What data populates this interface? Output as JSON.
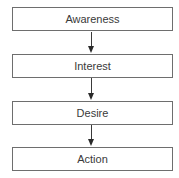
{
  "diagram": {
    "type": "flowchart",
    "direction": "top-to-bottom",
    "nodes": [
      {
        "id": "awareness",
        "label": "Awareness"
      },
      {
        "id": "interest",
        "label": "Interest"
      },
      {
        "id": "desire",
        "label": "Desire"
      },
      {
        "id": "action",
        "label": "Action"
      }
    ],
    "edges": [
      {
        "from": "awareness",
        "to": "interest"
      },
      {
        "from": "interest",
        "to": "desire"
      },
      {
        "from": "desire",
        "to": "action"
      }
    ],
    "colors": {
      "border": "#6e6e6e",
      "text": "#3a3a3a",
      "arrow": "#2a2a2a",
      "background": "#ffffff"
    }
  }
}
